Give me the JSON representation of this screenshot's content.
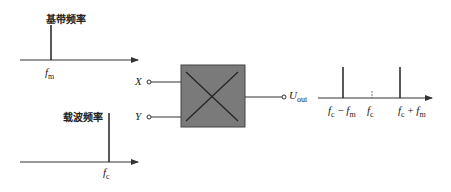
{
  "baseband": {
    "title": "基带频率",
    "freq_label": "f",
    "freq_sub": "m"
  },
  "carrier": {
    "title": "载波频率",
    "freq_label": "f",
    "freq_sub": "c"
  },
  "multiplier": {
    "input_x": "X",
    "input_y": "Y",
    "output": "U",
    "output_sub": "out",
    "box_color": "#7a7a7a"
  },
  "output_spectrum": {
    "lower": {
      "f": "f",
      "sub1": "c",
      "op": " − ",
      "f2": "f",
      "sub2": "m"
    },
    "center": {
      "f": "f",
      "sub": "c"
    },
    "upper": {
      "f": "f",
      "sub1": "c",
      "op": " + ",
      "f2": "f",
      "sub2": "m"
    }
  }
}
